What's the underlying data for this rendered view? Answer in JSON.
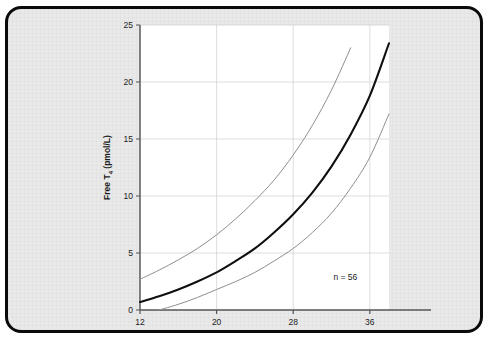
{
  "figure": {
    "background_color": "#e9e9e9",
    "border_color": "#0a0a0a",
    "plot_background": "#ffffff"
  },
  "annotations": {
    "sample_size": "n = 56"
  },
  "axis_titles": {
    "x": "Gestation (weeks)",
    "y_prefix": "Free T",
    "y_subscript": "4",
    "y_suffix": " (pmol/L)"
  },
  "chart_data": {
    "type": "line",
    "title": "",
    "xlabel": "Gestation (weeks)",
    "ylabel": "Free T4 (pmol/L)",
    "xlim": [
      12,
      38
    ],
    "ylim": [
      0,
      25
    ],
    "xticks": [
      12,
      20,
      28,
      36
    ],
    "yticks": [
      0,
      5,
      10,
      15,
      20,
      25
    ],
    "xticklabels": [
      "12",
      "20",
      "28",
      "36"
    ],
    "yticklabels": [
      "0",
      "5",
      "10",
      "15",
      "20",
      "25"
    ],
    "grid": true,
    "legend": "none",
    "annotation_text": "n = 56",
    "x": [
      12,
      14,
      16,
      18,
      20,
      22,
      24,
      26,
      28,
      30,
      32,
      34,
      36,
      38
    ],
    "series": [
      {
        "name": "upper limit",
        "style": "thin-gray",
        "color": "#8e8e8e",
        "values": [
          2.7,
          3.5,
          4.4,
          5.4,
          6.6,
          8.0,
          9.6,
          11.4,
          13.6,
          16.2,
          19.3,
          23.0,
          null,
          null
        ]
      },
      {
        "name": "median",
        "style": "thick-black",
        "color": "#101010",
        "values": [
          0.7,
          1.2,
          1.8,
          2.5,
          3.3,
          4.3,
          5.4,
          6.8,
          8.4,
          10.3,
          12.6,
          15.4,
          18.8,
          23.4
        ]
      },
      {
        "name": "lower limit",
        "style": "thin-gray",
        "color": "#8e8e8e",
        "values": [
          null,
          0.0,
          0.5,
          1.1,
          1.8,
          2.5,
          3.3,
          4.3,
          5.4,
          6.8,
          8.5,
          10.7,
          13.4,
          17.2
        ]
      }
    ]
  }
}
